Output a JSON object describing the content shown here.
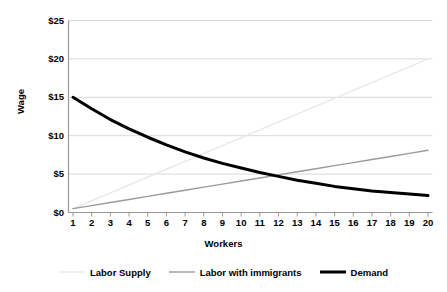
{
  "chart_data": {
    "type": "line",
    "title": "",
    "xlabel": "Workers",
    "ylabel": "Wage",
    "x": [
      1,
      2,
      3,
      4,
      5,
      6,
      7,
      8,
      9,
      10,
      11,
      12,
      13,
      14,
      15,
      16,
      17,
      18,
      19,
      20
    ],
    "xtick_labels": [
      "1",
      "2",
      "3",
      "4",
      "5",
      "6",
      "7",
      "8",
      "9",
      "10",
      "11",
      "12",
      "13",
      "14",
      "15",
      "16",
      "17",
      "18",
      "19",
      "20"
    ],
    "ytick_labels": [
      "$0",
      "$5",
      "$10",
      "$15",
      "$20",
      "$25"
    ],
    "ytick_values": [
      0,
      5,
      10,
      15,
      20,
      25
    ],
    "ylim": [
      0,
      25
    ],
    "xlim": [
      1,
      20
    ],
    "grid": "horizontal",
    "legend_position": "bottom",
    "series": [
      {
        "name": "Labor Supply",
        "color": "#e8e8e8",
        "width": 1.4,
        "values": [
          0.5,
          1.53,
          2.55,
          3.58,
          4.61,
          5.63,
          6.66,
          7.68,
          8.71,
          9.74,
          10.76,
          11.79,
          12.82,
          13.84,
          14.87,
          15.89,
          16.92,
          17.95,
          18.97,
          20.0
        ]
      },
      {
        "name": "Labor with immigrants",
        "color": "#9a9a9a",
        "width": 1.4,
        "values": [
          0.5,
          0.9,
          1.3,
          1.7,
          2.1,
          2.5,
          2.9,
          3.3,
          3.7,
          4.1,
          4.5,
          4.9,
          5.3,
          5.7,
          6.1,
          6.5,
          6.9,
          7.3,
          7.7,
          8.1
        ]
      },
      {
        "name": "Demand",
        "color": "#000000",
        "width": 3.0,
        "values": [
          15.0,
          13.5,
          12.1,
          10.9,
          9.8,
          8.8,
          7.9,
          7.1,
          6.4,
          5.8,
          5.2,
          4.7,
          4.2,
          3.8,
          3.4,
          3.1,
          2.8,
          2.6,
          2.4,
          2.2
        ]
      }
    ]
  },
  "legend": {
    "items": [
      {
        "label": "Labor Supply"
      },
      {
        "label": "Labor with immigrants"
      },
      {
        "label": "Demand"
      }
    ]
  },
  "colors": {
    "axis": "#9a9a9a",
    "grid": "#d9d9d9",
    "text": "#000000",
    "background": "#ffffff"
  }
}
